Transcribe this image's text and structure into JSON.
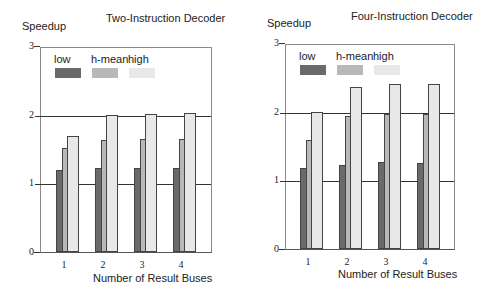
{
  "chart_data": [
    {
      "type": "bar",
      "title": "Two-Instruction Decoder",
      "xlabel": "Number of Result Buses",
      "ylabel": "Speedup",
      "ylim": [
        0,
        3
      ],
      "yticks": [
        "0",
        "1",
        "2",
        "3"
      ],
      "categories": [
        "1",
        "2",
        "3",
        "4"
      ],
      "grid": "horizontal lines at 1 and 2",
      "legend_position": "top-left inside plot",
      "series": [
        {
          "name": "low",
          "color": "#6a6a6a",
          "values": [
            1.19,
            1.22,
            1.23,
            1.23
          ]
        },
        {
          "name": "h-mean",
          "color": "#b8b8b8",
          "values": [
            1.51,
            1.63,
            1.65,
            1.65
          ]
        },
        {
          "name": "high",
          "color": "#e8e8e8",
          "values": [
            1.69,
            1.99,
            2.01,
            2.02
          ]
        }
      ]
    },
    {
      "type": "bar",
      "title": "Four-Instruction Decoder",
      "xlabel": "Number of Result Buses",
      "ylabel": "Speedup",
      "ylim": [
        0,
        3
      ],
      "yticks": [
        "0",
        "1",
        "2",
        "3"
      ],
      "categories": [
        "1",
        "2",
        "3",
        "4"
      ],
      "grid": "horizontal lines at 1 and 2",
      "legend_position": "top-left inside plot",
      "series": [
        {
          "name": "low",
          "color": "#6a6a6a",
          "values": [
            1.18,
            1.23,
            1.26,
            1.25
          ]
        },
        {
          "name": "h-mean",
          "color": "#b8b8b8",
          "values": [
            1.59,
            1.94,
            1.96,
            1.97
          ]
        },
        {
          "name": "high",
          "color": "#e8e8e8",
          "values": [
            1.99,
            2.36,
            2.41,
            2.4
          ]
        }
      ]
    }
  ]
}
